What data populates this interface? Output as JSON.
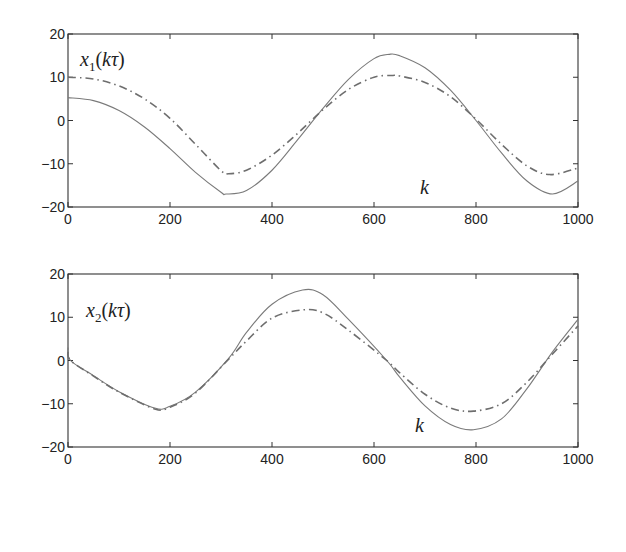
{
  "chart_data": [
    {
      "type": "line",
      "title": "",
      "ylabel_annotation": {
        "var": "x",
        "sub": "1",
        "arg": "kτ"
      },
      "xlabel_annotation": "k",
      "xlim": [
        0,
        1000
      ],
      "ylim": [
        -20,
        20
      ],
      "xticks": [
        0,
        200,
        400,
        600,
        800,
        1000
      ],
      "yticks": [
        20,
        10,
        0,
        -10,
        -20
      ],
      "grid": false,
      "series": [
        {
          "name": "solid",
          "style": "solid",
          "x": [
            0,
            50,
            100,
            150,
            200,
            250,
            300,
            310,
            350,
            400,
            450,
            500,
            550,
            600,
            630,
            650,
            700,
            750,
            800,
            850,
            900,
            950,
            1000
          ],
          "y": [
            5.3,
            4.6,
            2.3,
            -1.5,
            -6.5,
            -12,
            -16.6,
            -17,
            -16.2,
            -11.5,
            -4.5,
            2.8,
            9.5,
            14.3,
            15.3,
            15.0,
            12.2,
            7.0,
            0.0,
            -7.5,
            -14,
            -17,
            -14
          ]
        },
        {
          "name": "dash-dot",
          "style": "dashdot",
          "x": [
            0,
            50,
            100,
            150,
            200,
            250,
            300,
            315,
            350,
            400,
            450,
            500,
            550,
            600,
            635,
            650,
            700,
            750,
            800,
            850,
            900,
            945,
            1000
          ],
          "y": [
            10,
            9.6,
            8.0,
            5.0,
            0.5,
            -5.5,
            -11.6,
            -12.3,
            -11.5,
            -8.0,
            -3.0,
            2.5,
            7.2,
            10.0,
            10.4,
            10.3,
            8.8,
            5.5,
            0.3,
            -5.5,
            -10.5,
            -12.5,
            -11
          ]
        }
      ]
    },
    {
      "type": "line",
      "title": "",
      "ylabel_annotation": {
        "var": "x",
        "sub": "2",
        "arg": "kτ"
      },
      "xlabel_annotation": "k",
      "xlim": [
        0,
        1000
      ],
      "ylim": [
        -20,
        20
      ],
      "xticks": [
        0,
        200,
        400,
        600,
        800,
        1000
      ],
      "yticks": [
        20,
        10,
        0,
        -10,
        -20
      ],
      "grid": false,
      "series": [
        {
          "name": "solid",
          "style": "solid",
          "x": [
            0,
            5,
            50,
            100,
            170,
            200,
            250,
            315,
            350,
            400,
            460,
            500,
            550,
            625,
            650,
            700,
            750,
            795,
            850,
            900,
            950,
            1000
          ],
          "y": [
            3,
            0,
            -3.5,
            -7.2,
            -11,
            -10.6,
            -7.3,
            0.5,
            6.5,
            13.0,
            16.3,
            15.2,
            9.5,
            0.0,
            -3.8,
            -10.5,
            -14.8,
            -16,
            -13.5,
            -6.5,
            2.0,
            9.5
          ]
        },
        {
          "name": "dash-dot",
          "style": "dashdot",
          "x": [
            0,
            5,
            50,
            100,
            170,
            200,
            250,
            315,
            350,
            400,
            460,
            500,
            550,
            625,
            650,
            700,
            750,
            795,
            850,
            900,
            950,
            1000
          ],
          "y": [
            2,
            0,
            -3.6,
            -7.3,
            -11.2,
            -10.8,
            -7.5,
            0.3,
            4.5,
            9.8,
            11.7,
            11.0,
            7.0,
            0.0,
            -2.8,
            -7.8,
            -11.0,
            -11.7,
            -10.0,
            -5.0,
            1.5,
            8.0
          ]
        }
      ]
    }
  ],
  "labels": {
    "top": {
      "var": "x",
      "sub": "1",
      "open": "(",
      "arg": "kτ",
      "close": ")",
      "xaxis": "k"
    },
    "bottom": {
      "var": "x",
      "sub": "2",
      "open": "(",
      "arg": "kτ",
      "close": ")",
      "xaxis": "k"
    }
  },
  "colors": {
    "solid": "#7a7a7a",
    "dashdot": "#6e6e6e",
    "axes": "#333333"
  }
}
